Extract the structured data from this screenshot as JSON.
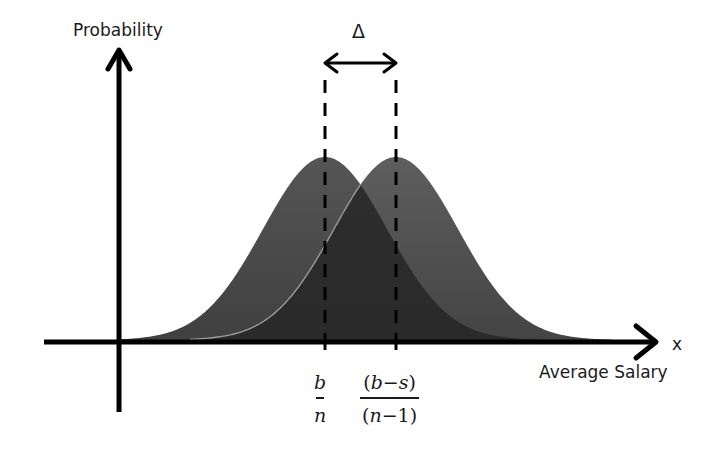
{
  "diagram": {
    "title": "",
    "y_axis_label": "Probability",
    "x_axis_variable": "x",
    "x_axis_title": "Average Salary",
    "delta_label": "Δ",
    "markers": [
      {
        "id": "left-mean",
        "numerator": "b",
        "denominator": "n",
        "x_px": 325
      },
      {
        "id": "right-mean",
        "numerator_parts": [
          "(",
          "b",
          "−",
          "s",
          ")"
        ],
        "numerator": "(b−s)",
        "denominator_parts": [
          "(",
          "n",
          "−",
          "1",
          ")"
        ],
        "denominator": "(n−1)",
        "x_px": 396
      }
    ],
    "curves": [
      {
        "name": "distribution-1",
        "mean_px": 325,
        "shape": "normal",
        "color": "#4a4a4a"
      },
      {
        "name": "distribution-2",
        "mean_px": 396,
        "shape": "normal",
        "color": "#555555"
      }
    ],
    "colors": {
      "axis": "#000000",
      "curve_left": "#4b4b4b",
      "curve_right": "#585858",
      "overlap": "#262626",
      "edge_highlight": "#9a9a9a",
      "text": "#1a1a1a"
    }
  }
}
